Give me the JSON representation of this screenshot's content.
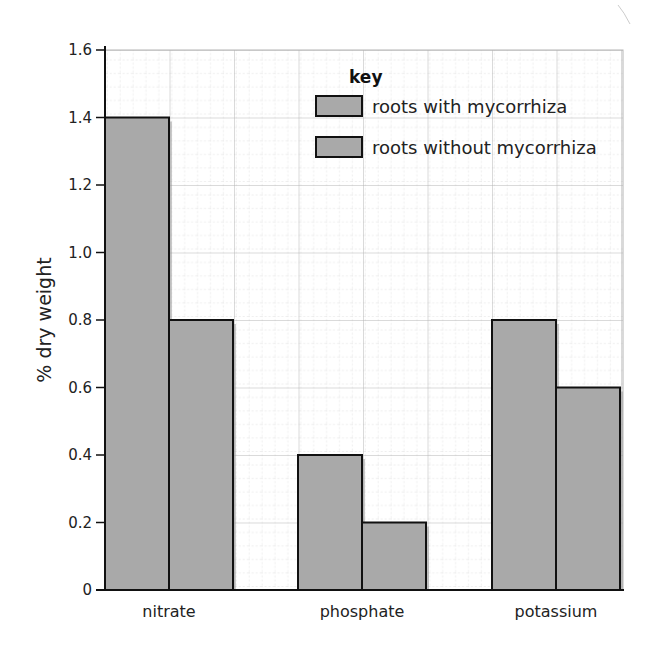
{
  "chart_data": {
    "type": "bar",
    "title": "",
    "xlabel": "",
    "ylabel": "% dry weight",
    "ylim": [
      0,
      1.6
    ],
    "yticks": [
      "0",
      "0.2",
      "0.4",
      "0.6",
      "0.8",
      "1.0",
      "1.2",
      "1.4",
      "1.6"
    ],
    "grid": true,
    "categories": [
      "nitrate",
      "phosphate",
      "potassium"
    ],
    "series": [
      {
        "name": "roots with mycorrhiza",
        "values": [
          1.4,
          0.4,
          0.8
        ],
        "color": "#a9a9a9"
      },
      {
        "name": "roots without mycorrhiza",
        "values": [
          0.8,
          0.2,
          0.6
        ],
        "color": "#a9a9a9"
      }
    ],
    "legend": {
      "title": "key",
      "position": "top-right"
    }
  },
  "labels": {
    "ylabel": "% dry weight",
    "key_title": "key",
    "key_item_1": "roots with mycorrhiza",
    "key_item_2": "roots without mycorrhiza",
    "cat_1": "nitrate",
    "cat_2": "phosphate",
    "cat_3": "potassium",
    "tick_0": "0",
    "tick_1": "0.2",
    "tick_2": "0.4",
    "tick_3": "0.6",
    "tick_4": "0.8",
    "tick_5": "1.0",
    "tick_6": "1.2",
    "tick_7": "1.4",
    "tick_8": "1.6"
  }
}
